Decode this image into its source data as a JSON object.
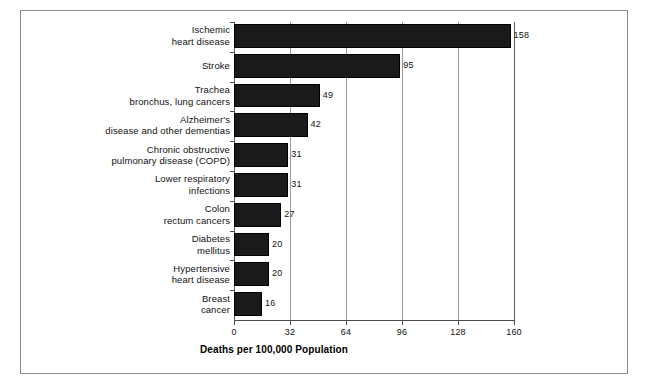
{
  "figure": {
    "background_color": "#ffffff",
    "frame_color": "#8d8d8d",
    "bar_color": "#1a1a1a"
  },
  "chart_data": {
    "type": "bar",
    "orientation": "horizontal",
    "title": "",
    "xlabel": "Deaths per 100,000 Population",
    "ylabel": "",
    "xlim": [
      0,
      160
    ],
    "xticks": [
      0,
      32,
      64,
      96,
      128,
      160
    ],
    "xticklabels": [
      "0",
      "32",
      "64",
      "96",
      "128",
      "160"
    ],
    "grid": true,
    "legend": false,
    "categories": [
      "Ischemic heart disease",
      "Stroke",
      "Trachea bronchus, lung cancers",
      "Alzheimer's disease and other dementias",
      "Chronic obstructive pulmonary disease (COPD)",
      "Lower respiratory infections",
      "Colon rectum cancers",
      "Diabetes mellitus",
      "Hypertensive heart disease",
      "Breast cancer"
    ],
    "category_lines": [
      [
        "Ischemic",
        "heart disease"
      ],
      [
        "Stroke"
      ],
      [
        "Trachea",
        "bronchus, lung cancers"
      ],
      [
        "Alzheimer's",
        "disease and other dementias"
      ],
      [
        "Chronic obstructive",
        "pulmonary disease (COPD)"
      ],
      [
        "Lower respiratory",
        "infections"
      ],
      [
        "Colon",
        "rectum cancers"
      ],
      [
        "Diabetes",
        "mellitus"
      ],
      [
        "Hypertensive",
        "heart disease"
      ],
      [
        "Breast",
        "cancer"
      ]
    ],
    "values": [
      158,
      95,
      49,
      42,
      31,
      31,
      27,
      20,
      20,
      16
    ],
    "value_labels": [
      "158",
      "95",
      "49",
      "42",
      "31",
      "31",
      "27",
      "20",
      "20",
      "16"
    ]
  }
}
